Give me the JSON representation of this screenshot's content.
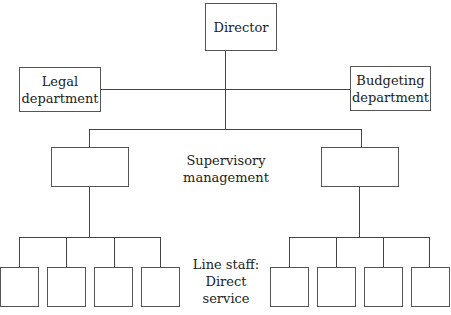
{
  "diagram": {
    "type": "org-chart",
    "top": {
      "label": "Director"
    },
    "staff": [
      {
        "label": "Legal\ndepartment",
        "line1": "Legal",
        "line2": "department"
      },
      {
        "label": "Budgeting\ndepartment",
        "line1": "Budgeting",
        "line2": "department"
      }
    ],
    "levels": {
      "supervisory": {
        "line1": "Supervisory",
        "line2": "management",
        "box_count": 2
      },
      "line_staff": {
        "line1": "Line staff:",
        "line2": "Direct service",
        "box_count": 8
      }
    },
    "colors": {
      "line": "#444444",
      "box_border": "#555555",
      "background": "#ffffff"
    }
  }
}
